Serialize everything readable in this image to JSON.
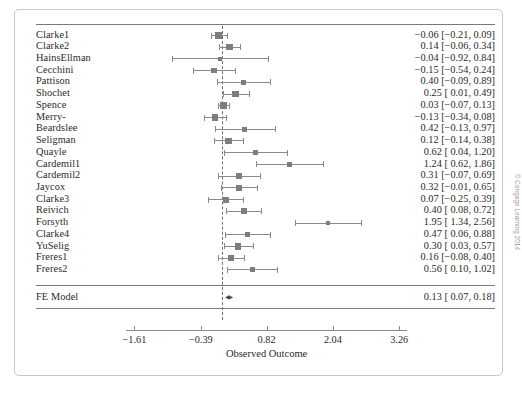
{
  "figure": {
    "x_axis_title": "Observed Outcome",
    "summary_label": "FE Model",
    "copyright": "© Cengage Learning 2014"
  },
  "chart_data": {
    "type": "forest",
    "title": "",
    "xlabel": "Observed Outcome",
    "ylabel": "",
    "xlim": [
      -1.95,
      3.55
    ],
    "reference_line": 0,
    "grid": false,
    "legend": "none",
    "tick_values": [
      -1.61,
      -0.39,
      0.82,
      2.04,
      3.26
    ],
    "tick_labels": [
      "−1.61",
      "−0.39",
      "0.82",
      "2.04",
      "3.26"
    ],
    "studies": [
      {
        "label": "Clarke1",
        "estimate": -0.06,
        "ci_low": -0.21,
        "ci_high": 0.09,
        "text": "−0.06 [−0.21, 0.09]"
      },
      {
        "label": "Clarke2",
        "estimate": 0.14,
        "ci_low": -0.06,
        "ci_high": 0.34,
        "text": "0.14 [−0.06, 0.34]"
      },
      {
        "label": "HainsEllman",
        "estimate": -0.04,
        "ci_low": -0.92,
        "ci_high": 0.84,
        "text": "−0.04 [−0.92, 0.84]"
      },
      {
        "label": "Cecchini",
        "estimate": -0.15,
        "ci_low": -0.54,
        "ci_high": 0.24,
        "text": "−0.15 [−0.54, 0.24]"
      },
      {
        "label": "Pattison",
        "estimate": 0.4,
        "ci_low": -0.09,
        "ci_high": 0.89,
        "text": "0.40 [−0.09, 0.89]"
      },
      {
        "label": "Shochet",
        "estimate": 0.25,
        "ci_low": 0.01,
        "ci_high": 0.49,
        "text": "0.25 [   0.01, 0.49]"
      },
      {
        "label": "Spence",
        "estimate": 0.03,
        "ci_low": -0.07,
        "ci_high": 0.13,
        "text": "0.03 [−0.07, 0.13]"
      },
      {
        "label": "Merry-",
        "estimate": -0.13,
        "ci_low": -0.34,
        "ci_high": 0.08,
        "text": "−0.13 [−0.34, 0.08]"
      },
      {
        "label": "Beardslee",
        "estimate": 0.42,
        "ci_low": -0.13,
        "ci_high": 0.97,
        "text": "0.42 [−0.13, 0.97]"
      },
      {
        "label": "Seligman",
        "estimate": 0.12,
        "ci_low": -0.14,
        "ci_high": 0.38,
        "text": "0.12 [−0.14, 0.38]"
      },
      {
        "label": "Quayle",
        "estimate": 0.62,
        "ci_low": 0.04,
        "ci_high": 1.2,
        "text": "0.62 [   0.04, 1.20]"
      },
      {
        "label": "Cardemil1",
        "estimate": 1.24,
        "ci_low": 0.62,
        "ci_high": 1.86,
        "text": "1.24 [   0.62, 1.86]"
      },
      {
        "label": "Cardemil2",
        "estimate": 0.31,
        "ci_low": -0.07,
        "ci_high": 0.69,
        "text": "0.31 [−0.07, 0.69]"
      },
      {
        "label": "Jaycox",
        "estimate": 0.32,
        "ci_low": -0.01,
        "ci_high": 0.65,
        "text": "0.32 [−0.01, 0.65]"
      },
      {
        "label": "Clarke3",
        "estimate": 0.07,
        "ci_low": -0.25,
        "ci_high": 0.39,
        "text": "0.07 [−0.25, 0.39]"
      },
      {
        "label": "Reivich",
        "estimate": 0.4,
        "ci_low": 0.08,
        "ci_high": 0.72,
        "text": "0.40 [   0.08, 0.72]"
      },
      {
        "label": "Forsyth",
        "estimate": 1.95,
        "ci_low": 1.34,
        "ci_high": 2.56,
        "text": "1.95 [   1.34, 2.56]"
      },
      {
        "label": "Clarke4",
        "estimate": 0.47,
        "ci_low": 0.06,
        "ci_high": 0.88,
        "text": "0.47 [   0.06, 0.88]"
      },
      {
        "label": "YuSelig",
        "estimate": 0.3,
        "ci_low": 0.03,
        "ci_high": 0.57,
        "text": "0.30 [   0.03, 0.57]"
      },
      {
        "label": "Freres1",
        "estimate": 0.16,
        "ci_low": -0.08,
        "ci_high": 0.4,
        "text": "0.16 [−0.08, 0.40]"
      },
      {
        "label": "Freres2",
        "estimate": 0.56,
        "ci_low": 0.1,
        "ci_high": 1.02,
        "text": "0.56 [   0.10, 1.02]"
      }
    ],
    "summary": {
      "label": "FE Model",
      "estimate": 0.13,
      "ci_low": 0.07,
      "ci_high": 0.18,
      "text": "0.13 [   0.07, 0.18]"
    }
  }
}
